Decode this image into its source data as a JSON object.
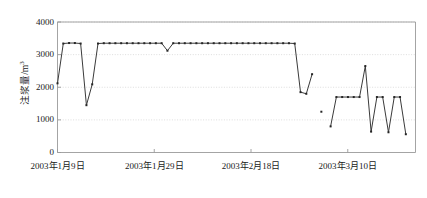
{
  "chart_data": {
    "type": "line",
    "title": "",
    "xlabel": "",
    "ylabel": "注浆量/m³",
    "ylabel_text": "注浆量/m",
    "ylabel_superscript": "3",
    "ylim": [
      0,
      4000
    ],
    "yticks": [
      0,
      1000,
      2000,
      3000,
      4000
    ],
    "ytick_labels": [
      "0",
      "1000",
      "2000",
      "3000",
      "4000"
    ],
    "xtick_labels": [
      "2003年1月9日",
      "2003年1月29日",
      "2003年2月18日",
      "2003年3月10日"
    ],
    "xtick_indices": [
      0,
      20,
      40,
      60
    ],
    "xlim": [
      0,
      74
    ],
    "grid": true,
    "grid_axis": "y",
    "legend": false,
    "marker": "square",
    "line_color": "#3a3a3a",
    "marker_color": "#262626",
    "grid_color": "#cfcfcf",
    "frame_color": "#9a9a9a",
    "series": [
      {
        "name": "注浆量",
        "x": [
          0,
          1,
          2,
          3,
          4,
          5,
          6,
          7,
          8,
          9,
          10,
          11,
          12,
          13,
          14,
          15,
          16,
          17,
          18,
          19,
          20,
          21,
          22,
          23,
          24,
          25,
          26,
          27,
          28,
          29,
          30,
          31,
          32,
          33,
          34,
          35,
          36,
          37,
          38,
          39,
          40,
          41,
          42,
          43,
          44,
          45,
          46,
          47,
          48
        ],
        "values": [
          2120,
          3340,
          3360,
          3340,
          3350,
          1450,
          2090,
          3340,
          3350,
          3340,
          3350,
          3350,
          3350,
          3350,
          3350,
          3350,
          3350,
          3340,
          3120,
          3340,
          3350,
          3350,
          3350,
          3350,
          3350,
          3350,
          3350,
          3350,
          3350,
          3350,
          3350,
          3350,
          3350,
          3350,
          3350,
          3350,
          3350,
          3350,
          3350,
          3350,
          3340,
          1850,
          1760,
          2400,
          1250,
          800,
          1700,
          1700,
          1700
        ],
        "segment_breaks": [
          44
        ]
      }
    ],
    "points": [
      {
        "x": 0,
        "y": 2120
      },
      {
        "x": 1,
        "y": 3340
      },
      {
        "x": 2,
        "y": 3360
      },
      {
        "x": 3,
        "y": 3340
      },
      {
        "x": 4,
        "y": 1450
      },
      {
        "x": 5,
        "y": 2090
      },
      {
        "x": 6,
        "y": 3340
      },
      {
        "x": 7,
        "y": 3350
      },
      {
        "x": 8,
        "y": 3350
      },
      {
        "x": 9,
        "y": 3350
      },
      {
        "x": 10,
        "y": 3350
      },
      {
        "x": 11,
        "y": 3120
      },
      {
        "x": 12,
        "y": 3350
      },
      {
        "x": 13,
        "y": 3350
      },
      {
        "x": 14,
        "y": 3350
      },
      {
        "x": 15,
        "y": 1850
      },
      {
        "x": 16,
        "y": 2400
      },
      {
        "x": 17,
        "y": 1250
      },
      {
        "x": 18,
        "y": 800
      },
      {
        "x": 19,
        "y": 1700
      },
      {
        "x": 20,
        "y": 2650
      },
      {
        "x": 21,
        "y": 650
      },
      {
        "x": 22,
        "y": 1700
      },
      {
        "x": 23,
        "y": 620
      },
      {
        "x": 24,
        "y": 1700
      },
      {
        "x": 25,
        "y": 560
      }
    ]
  }
}
